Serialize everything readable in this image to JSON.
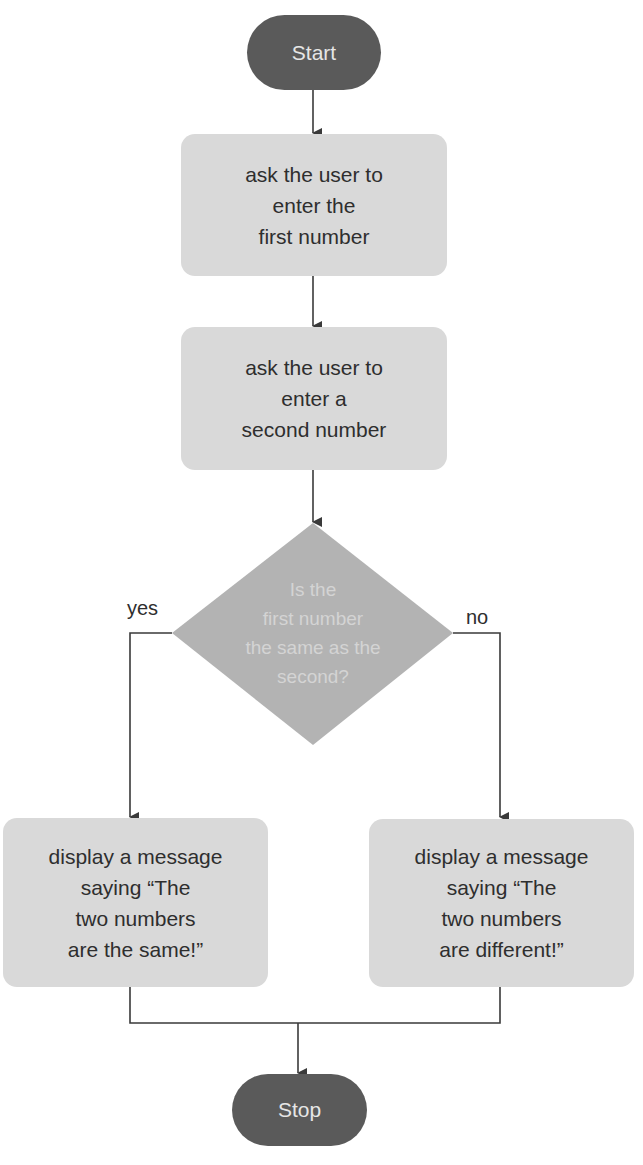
{
  "colors": {
    "terminal_fill": "#5a5a5a",
    "terminal_text": "#e6e6e6",
    "process_fill": "#d9d9d9",
    "process_text": "#2e2e2e",
    "decision_fill": "#b3b3b3",
    "decision_text": "#d9d9d9",
    "line": "#3a3a3a"
  },
  "nodes": {
    "start": {
      "type": "terminal",
      "label": "Start"
    },
    "ask_first": {
      "type": "process",
      "lines": [
        "ask the user to",
        "enter the",
        "first number"
      ]
    },
    "ask_second": {
      "type": "process",
      "lines": [
        "ask the user to",
        "enter a",
        "second number"
      ]
    },
    "decision": {
      "type": "decision",
      "lines": [
        "Is the",
        "first number",
        "the same as the",
        "second?"
      ]
    },
    "same_msg": {
      "type": "process",
      "lines": [
        "display a message",
        "saying “The",
        "two numbers",
        "are the same!”"
      ]
    },
    "diff_msg": {
      "type": "process",
      "lines": [
        "display a message",
        "saying “The",
        "two numbers",
        "are different!”"
      ]
    },
    "stop": {
      "type": "terminal",
      "label": "Stop"
    }
  },
  "edges": {
    "yes_label": "yes",
    "no_label": "no"
  }
}
